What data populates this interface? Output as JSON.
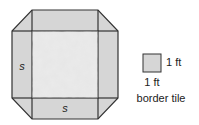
{
  "diagram": {
    "side_label_left": "s",
    "side_label_bottom": "s",
    "legend": {
      "side_right": "1 ft",
      "side_bottom": "1 ft",
      "caption": "border tile"
    },
    "colors": {
      "border_tile": "#d6d6d6",
      "inner_square": "#e4e4e4",
      "stroke": "#333333"
    }
  }
}
